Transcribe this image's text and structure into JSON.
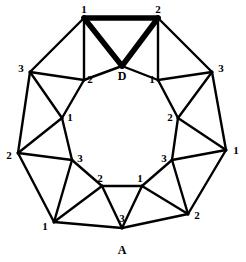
{
  "figure": {
    "type": "graph-diagram",
    "shape": "octagon",
    "background_color": "#ffffff",
    "stroke_color": "#000000"
  },
  "outer_vertices": [
    {
      "id": "outer-top-left",
      "label": "1",
      "x": 84,
      "y": 18,
      "label_x": 84,
      "label_y": 9
    },
    {
      "id": "outer-top-right",
      "label": "2",
      "x": 158,
      "y": 18,
      "label_x": 158,
      "label_y": 9
    },
    {
      "id": "outer-right-upper",
      "label": "3",
      "x": 212,
      "y": 72,
      "label_x": 221,
      "label_y": 68
    },
    {
      "id": "outer-right",
      "label": "1",
      "x": 226,
      "y": 150,
      "label_x": 236,
      "label_y": 150
    },
    {
      "id": "outer-bottom-right",
      "label": "2",
      "x": 188,
      "y": 214,
      "label_x": 197,
      "label_y": 215
    },
    {
      "id": "outer-bottom-left",
      "label": "1",
      "x": 54,
      "y": 222,
      "label_x": 45,
      "label_y": 226
    },
    {
      "id": "outer-left",
      "label": "2",
      "x": 18,
      "y": 153,
      "label_x": 9,
      "label_y": 155
    },
    {
      "id": "outer-left-upper",
      "label": "3",
      "x": 30,
      "y": 72,
      "label_x": 21,
      "label_y": 68
    }
  ],
  "inner_vertices": [
    {
      "id": "inner-top",
      "label": "D",
      "x": 122,
      "y": 66,
      "label_x": 122,
      "label_y": 76,
      "style": "letter"
    },
    {
      "id": "inner-top-right",
      "label": "1",
      "x": 158,
      "y": 80,
      "label_x": 152,
      "label_y": 79
    },
    {
      "id": "inner-right",
      "label": "2",
      "x": 178,
      "y": 118,
      "label_x": 170,
      "label_y": 117
    },
    {
      "id": "inner-bottom-right",
      "label": "3",
      "x": 172,
      "y": 160,
      "label_x": 164,
      "label_y": 158
    },
    {
      "id": "inner-bottom-east",
      "label": "1",
      "x": 142,
      "y": 186,
      "label_x": 140,
      "label_y": 178
    },
    {
      "id": "inner-bottom-west",
      "label": "2",
      "x": 102,
      "y": 186,
      "label_x": 100,
      "label_y": 178
    },
    {
      "id": "inner-bottom-left",
      "label": "3",
      "x": 72,
      "y": 160,
      "label_x": 80,
      "label_y": 158
    },
    {
      "id": "inner-left",
      "label": "1",
      "x": 62,
      "y": 118,
      "label_x": 70,
      "label_y": 117
    },
    {
      "id": "inner-top-left",
      "label": "2",
      "x": 84,
      "y": 80,
      "label_x": 90,
      "label_y": 79
    }
  ],
  "apex_vertex": {
    "id": "apex-bottom",
    "label": "A",
    "sub_label": "3",
    "x": 122,
    "y": 228,
    "label_x": 122,
    "label_y": 250,
    "sub_label_x": 122,
    "sub_label_y": 218
  },
  "edges": {
    "outer_ring": [
      {
        "from": "outer-top-left",
        "to": "outer-top-right",
        "weight": "bold"
      },
      {
        "from": "outer-top-right",
        "to": "outer-right-upper",
        "weight": "normal"
      },
      {
        "from": "outer-right-upper",
        "to": "outer-right",
        "weight": "normal"
      },
      {
        "from": "outer-right",
        "to": "outer-bottom-right",
        "weight": "normal"
      },
      {
        "from": "outer-bottom-right",
        "to": "apex-bottom",
        "weight": "normal"
      },
      {
        "from": "apex-bottom",
        "to": "outer-bottom-left",
        "weight": "normal"
      },
      {
        "from": "outer-bottom-left",
        "to": "outer-left",
        "weight": "normal"
      },
      {
        "from": "outer-left",
        "to": "outer-left-upper",
        "weight": "normal"
      },
      {
        "from": "outer-left-upper",
        "to": "outer-top-left",
        "weight": "normal"
      }
    ],
    "inner_ring": [
      {
        "from": "inner-top",
        "to": "inner-top-right",
        "weight": "normal"
      },
      {
        "from": "inner-top-right",
        "to": "inner-right",
        "weight": "normal"
      },
      {
        "from": "inner-right",
        "to": "inner-bottom-right",
        "weight": "normal"
      },
      {
        "from": "inner-bottom-right",
        "to": "inner-bottom-east",
        "weight": "normal"
      },
      {
        "from": "inner-bottom-east",
        "to": "inner-bottom-west",
        "weight": "normal"
      },
      {
        "from": "inner-bottom-west",
        "to": "inner-bottom-left",
        "weight": "normal"
      },
      {
        "from": "inner-bottom-left",
        "to": "inner-left",
        "weight": "normal"
      },
      {
        "from": "inner-left",
        "to": "inner-top-left",
        "weight": "normal"
      },
      {
        "from": "inner-top-left",
        "to": "inner-top",
        "weight": "normal"
      }
    ],
    "spokes": [
      {
        "from": "outer-top-left",
        "to": "inner-top-left",
        "weight": "normal"
      },
      {
        "from": "outer-top-left",
        "to": "inner-top",
        "weight": "bold"
      },
      {
        "from": "outer-top-right",
        "to": "inner-top",
        "weight": "bold"
      },
      {
        "from": "outer-top-right",
        "to": "inner-top-right",
        "weight": "normal"
      },
      {
        "from": "outer-right-upper",
        "to": "inner-top-right",
        "weight": "normal"
      },
      {
        "from": "outer-right-upper",
        "to": "inner-right",
        "weight": "normal"
      },
      {
        "from": "outer-right",
        "to": "inner-right",
        "weight": "normal"
      },
      {
        "from": "outer-right",
        "to": "inner-bottom-right",
        "weight": "normal"
      },
      {
        "from": "outer-bottom-right",
        "to": "inner-bottom-right",
        "weight": "normal"
      },
      {
        "from": "outer-bottom-right",
        "to": "inner-bottom-east",
        "weight": "normal"
      },
      {
        "from": "apex-bottom",
        "to": "inner-bottom-east",
        "weight": "normal"
      },
      {
        "from": "apex-bottom",
        "to": "inner-bottom-west",
        "weight": "normal"
      },
      {
        "from": "outer-bottom-left",
        "to": "inner-bottom-west",
        "weight": "normal"
      },
      {
        "from": "outer-bottom-left",
        "to": "inner-bottom-left",
        "weight": "normal"
      },
      {
        "from": "outer-left",
        "to": "inner-bottom-left",
        "weight": "normal"
      },
      {
        "from": "outer-left",
        "to": "inner-left",
        "weight": "normal"
      },
      {
        "from": "outer-left-upper",
        "to": "inner-left",
        "weight": "normal"
      },
      {
        "from": "outer-left-upper",
        "to": "inner-top-left",
        "weight": "normal"
      }
    ]
  }
}
